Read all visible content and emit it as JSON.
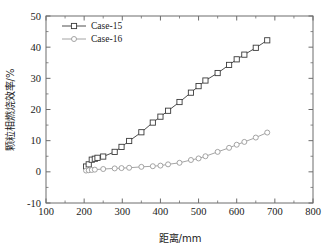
{
  "chart_data": {
    "type": "line",
    "title": "",
    "xlabel": "距离/mm",
    "ylabel": "颗粒相燃烧效率/%",
    "xlim": [
      100,
      800
    ],
    "ylim": [
      -10,
      50
    ],
    "xticks": [
      100,
      200,
      300,
      400,
      500,
      600,
      700,
      800
    ],
    "xtick_labels": [
      "100",
      "200",
      "300",
      "400",
      "500",
      "600",
      "700",
      "800"
    ],
    "yticks": [
      -10,
      0,
      10,
      20,
      30,
      40,
      50
    ],
    "ytick_labels": [
      "-10",
      "0",
      "10",
      "20",
      "30",
      "40",
      "50"
    ],
    "x_minor_step": 50,
    "y_minor_step": 5,
    "grid": false,
    "legend_position": "upper-left",
    "series": [
      {
        "name": "Case-15",
        "color": "#3a3a3a",
        "marker": "square",
        "x": [
          205,
          212,
          220,
          228,
          235,
          250,
          280,
          298,
          318,
          350,
          380,
          400,
          420,
          450,
          480,
          500,
          518,
          550,
          580,
          600,
          620,
          650,
          680
        ],
        "y": [
          1.7,
          2.4,
          3.9,
          4.2,
          4.5,
          4.9,
          6.4,
          8.0,
          9.9,
          12.7,
          15.8,
          17.7,
          19.6,
          22.4,
          25.4,
          27.5,
          29.3,
          31.7,
          34.3,
          36.1,
          37.6,
          39.8,
          42.2
        ]
      },
      {
        "name": "Case-16",
        "color": "#9a9a9a",
        "marker": "circle",
        "x": [
          205,
          212,
          220,
          228,
          250,
          280,
          298,
          318,
          350,
          380,
          400,
          420,
          450,
          480,
          500,
          518,
          550,
          580,
          600,
          620,
          650,
          680
        ],
        "y": [
          0.4,
          0.5,
          0.6,
          0.7,
          0.9,
          1.1,
          1.2,
          1.3,
          1.6,
          1.8,
          2.0,
          2.4,
          2.9,
          3.8,
          4.3,
          5.0,
          6.4,
          7.7,
          8.7,
          9.6,
          11.0,
          12.6
        ]
      }
    ]
  },
  "legend": {
    "items": [
      {
        "label": "Case-15"
      },
      {
        "label": "Case-16"
      }
    ]
  },
  "colors": {
    "series_1": "#3a3a3a",
    "series_2": "#9a9a9a",
    "axis": "#6d6d6d",
    "text": "#1a1a1a",
    "background": "#ffffff"
  }
}
